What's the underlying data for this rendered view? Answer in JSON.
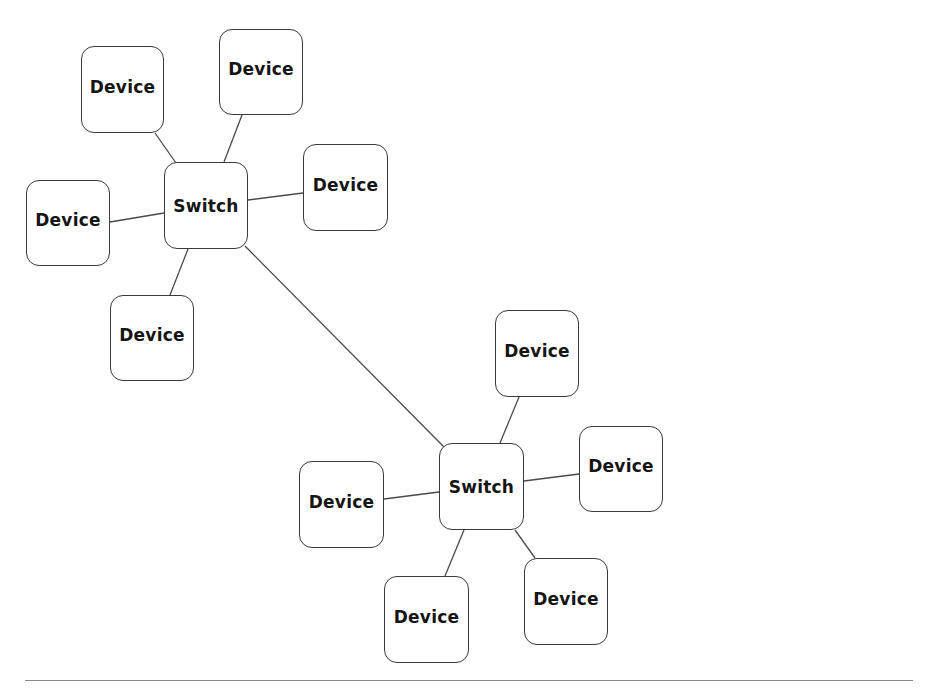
{
  "diagram": {
    "type": "network-topology",
    "colors": {
      "background": "#ffffff",
      "node_border": "#3a3a3a",
      "node_text": "#151515",
      "link": "#4a4a4a",
      "rule": "#8a8a8a"
    },
    "nodes": [
      {
        "id": "switch-1",
        "kind": "switch",
        "label": "Switch",
        "x": 164,
        "y": 162,
        "w": 84,
        "h": 87
      },
      {
        "id": "device-1",
        "kind": "device",
        "label": "Device",
        "x": 81,
        "y": 46,
        "w": 83,
        "h": 87
      },
      {
        "id": "device-2",
        "kind": "device",
        "label": "Device",
        "x": 219,
        "y": 29,
        "w": 84,
        "h": 86
      },
      {
        "id": "device-3",
        "kind": "device",
        "label": "Device",
        "x": 303,
        "y": 144,
        "w": 85,
        "h": 87
      },
      {
        "id": "device-4",
        "kind": "device",
        "label": "Device",
        "x": 26,
        "y": 180,
        "w": 84,
        "h": 86
      },
      {
        "id": "device-5",
        "kind": "device",
        "label": "Device",
        "x": 110,
        "y": 295,
        "w": 84,
        "h": 86
      },
      {
        "id": "switch-2",
        "kind": "switch",
        "label": "Switch",
        "x": 439,
        "y": 443,
        "w": 85,
        "h": 87
      },
      {
        "id": "device-6",
        "kind": "device",
        "label": "Device",
        "x": 495,
        "y": 310,
        "w": 84,
        "h": 87
      },
      {
        "id": "device-7",
        "kind": "device",
        "label": "Device",
        "x": 579,
        "y": 426,
        "w": 84,
        "h": 86
      },
      {
        "id": "device-8",
        "kind": "device",
        "label": "Device",
        "x": 299,
        "y": 461,
        "w": 85,
        "h": 87
      },
      {
        "id": "device-9",
        "kind": "device",
        "label": "Device",
        "x": 384,
        "y": 576,
        "w": 85,
        "h": 87
      },
      {
        "id": "device-10",
        "kind": "device",
        "label": "Device",
        "x": 524,
        "y": 558,
        "w": 84,
        "h": 87
      }
    ],
    "links": [
      {
        "from": "switch-1",
        "to": "device-1",
        "x1": 176,
        "y1": 163,
        "x2": 155,
        "y2": 133
      },
      {
        "from": "switch-1",
        "to": "device-2",
        "x1": 224,
        "y1": 162,
        "x2": 242,
        "y2": 115
      },
      {
        "from": "switch-1",
        "to": "device-3",
        "x1": 248,
        "y1": 200,
        "x2": 303,
        "y2": 193
      },
      {
        "from": "switch-1",
        "to": "device-4",
        "x1": 164,
        "y1": 213,
        "x2": 110,
        "y2": 222
      },
      {
        "from": "switch-1",
        "to": "device-5",
        "x1": 188,
        "y1": 249,
        "x2": 170,
        "y2": 295
      },
      {
        "from": "switch-1",
        "to": "switch-2",
        "x1": 245,
        "y1": 246,
        "x2": 444,
        "y2": 447
      },
      {
        "from": "switch-2",
        "to": "device-6",
        "x1": 500,
        "y1": 443,
        "x2": 519,
        "y2": 397
      },
      {
        "from": "switch-2",
        "to": "device-7",
        "x1": 524,
        "y1": 481,
        "x2": 579,
        "y2": 474
      },
      {
        "from": "switch-2",
        "to": "device-8",
        "x1": 439,
        "y1": 492,
        "x2": 384,
        "y2": 499
      },
      {
        "from": "switch-2",
        "to": "device-9",
        "x1": 464,
        "y1": 530,
        "x2": 445,
        "y2": 576
      },
      {
        "from": "switch-2",
        "to": "device-10",
        "x1": 515,
        "y1": 530,
        "x2": 535,
        "y2": 558
      }
    ]
  }
}
